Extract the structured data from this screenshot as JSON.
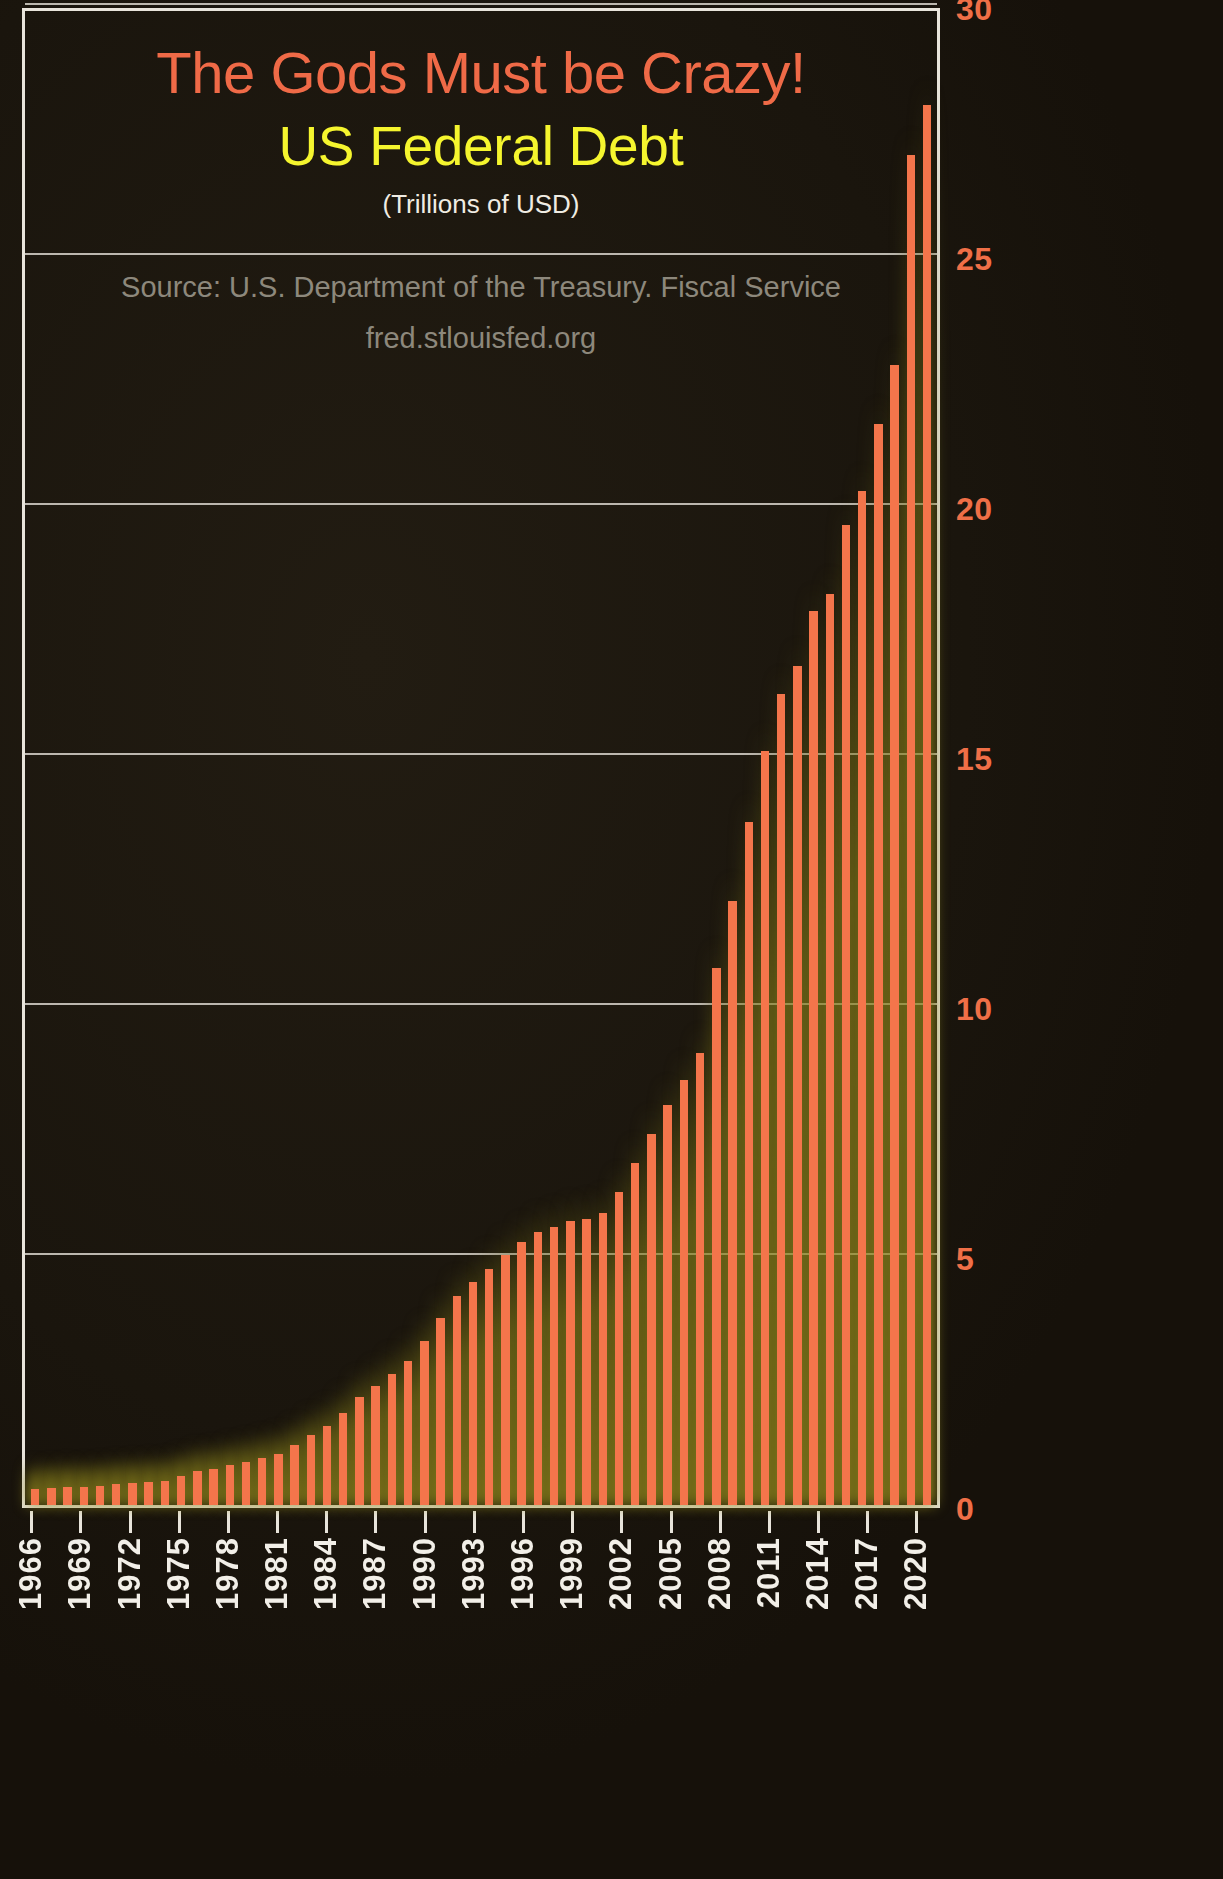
{
  "chart_data": {
    "type": "bar",
    "title": "The Gods Must be Crazy!",
    "subtitle": "US Federal Debt",
    "units": "(Trillions of USD)",
    "source": "Source: U.S. Department of the Treasury. Fiscal Service",
    "source_url": "fred.stlouisfed.org",
    "xlabel": "",
    "ylabel": "",
    "ylim": [
      0,
      30
    ],
    "ytick_values": [
      0,
      5,
      10,
      15,
      20,
      25,
      30
    ],
    "ytick_labels": [
      "0",
      "5",
      "10",
      "15",
      "20",
      "25",
      "30"
    ],
    "grid": true,
    "grid_axis": "y",
    "legend": "none",
    "axis_position": "right",
    "bar_color": "#f4754b",
    "glow_color": "#8d8420",
    "background_color": "#1a150d",
    "title_color": "#ef6a47",
    "subtitle_color": "#f5f52e",
    "units_color": "#f0ece3",
    "source_color": "#8d887c",
    "ytick_color": "#ef6f47",
    "xtick_color": "#f2efe8",
    "xtick_labels": [
      "1966",
      "1969",
      "1972",
      "1975",
      "1978",
      "1981",
      "1984",
      "1987",
      "1990",
      "1993",
      "1996",
      "1999",
      "2002",
      "2005",
      "2008",
      "2011",
      "2014",
      "2017",
      "2020"
    ],
    "xtick_step": 3,
    "categories": [
      "1966",
      "1967",
      "1968",
      "1969",
      "1970",
      "1971",
      "1972",
      "1973",
      "1974",
      "1975",
      "1976",
      "1977",
      "1978",
      "1979",
      "1980",
      "1981",
      "1982",
      "1983",
      "1984",
      "1985",
      "1986",
      "1987",
      "1988",
      "1989",
      "1990",
      "1991",
      "1992",
      "1993",
      "1994",
      "1995",
      "1996",
      "1997",
      "1998",
      "1999",
      "2000",
      "2001",
      "2002",
      "2003",
      "2004",
      "2005",
      "2006",
      "2007",
      "2008",
      "2009",
      "2010",
      "2011",
      "2012",
      "2013",
      "2014",
      "2015",
      "2016",
      "2017",
      "2018",
      "2019",
      "2020",
      "2021"
    ],
    "values": [
      0.32,
      0.34,
      0.37,
      0.37,
      0.39,
      0.42,
      0.45,
      0.47,
      0.49,
      0.58,
      0.68,
      0.73,
      0.8,
      0.87,
      0.94,
      1.03,
      1.2,
      1.41,
      1.58,
      1.85,
      2.16,
      2.38,
      2.63,
      2.89,
      3.29,
      3.75,
      4.18,
      4.46,
      4.73,
      5.0,
      5.27,
      5.46,
      5.57,
      5.68,
      5.72,
      5.84,
      6.26,
      6.85,
      7.43,
      8.0,
      8.51,
      9.04,
      10.75,
      12.08,
      13.67,
      15.09,
      16.22,
      16.79,
      17.89,
      18.22,
      19.61,
      20.29,
      21.62,
      22.8,
      27.0,
      28.0
    ]
  }
}
